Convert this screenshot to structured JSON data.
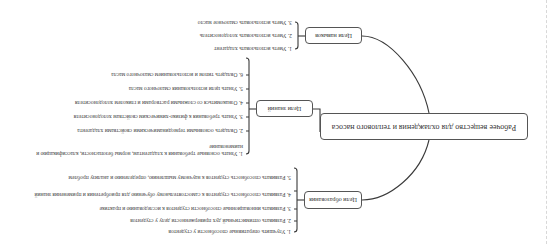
{
  "diagram": {
    "orientation_deg": 180,
    "central": {
      "label": "Рабочее вещество для охлаждения и теплового насоса"
    },
    "branches": [
      {
        "label": "Цели образования",
        "items": [
          "1. Улучшить оперативные способности у студентов",
          "2. Развивать оптимистичный дух приверженности делу у студентов",
          "3. Развивать инновационные способности студентов к исследованию и практике",
          "4. Развивать способность студентов к самостоятельному обучению для приобретения и применения знаний",
          "5. Развивать способность студентов к научному мышлению, определению и анализу проблем"
        ]
      },
      {
        "label": "Цели знаний",
        "items": [
          "1. Узнать основные требования к хладагентам, нормы безопасности, классификацию и наименование",
          "2. Овладеть основными термодинамическими свойствами хладагента",
          "3. Узнать требования к физико-химическим свойствам холодоносителя",
          "4. Ознакомиться со сложными растворами и гликолем холодоносителя",
          "5. Узнать цели использования смазочного масла",
          "6. Овладеть типом и использованием смазочного масла"
        ]
      },
      {
        "label": "Цели навыков",
        "items": [
          "1. Уметь использовать хладагент",
          "2. Уметь использовать холодоноситель",
          "3. Уметь использовать смазочное масло"
        ]
      }
    ]
  },
  "colors": {
    "line": "#3a3a3a",
    "text": "#444444",
    "border": "#555555"
  }
}
